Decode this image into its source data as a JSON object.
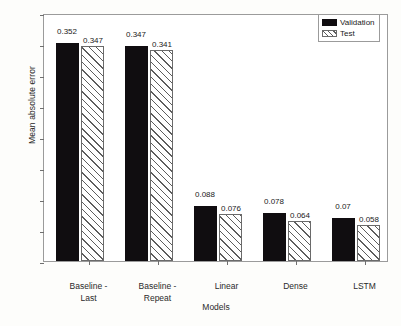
{
  "chart_data": {
    "type": "bar",
    "title": "",
    "xlabel": "Models",
    "ylabel": "Mean absolute error",
    "categories": [
      "Baseline -\nLast",
      "Baseline -\nRepeat",
      "Linear",
      "Dense",
      "LSTM"
    ],
    "category_lines": [
      [
        "Baseline -",
        "Last"
      ],
      [
        "Baseline -",
        "Repeat"
      ],
      [
        "Linear",
        ""
      ],
      [
        "Dense",
        ""
      ],
      [
        "LSTM",
        ""
      ]
    ],
    "series": [
      {
        "name": "Validation",
        "values": [
          0.352,
          0.347,
          0.088,
          0.078,
          0.07
        ],
        "labels": [
          "0.352",
          "0.347",
          "0.088",
          "0.078",
          "0.07"
        ],
        "color": "#100d10",
        "pattern": "solid"
      },
      {
        "name": "Test",
        "values": [
          0.347,
          0.341,
          0.076,
          0.064,
          0.058
        ],
        "labels": [
          "0.347",
          "0.341",
          "0.076",
          "0.064",
          "0.058"
        ],
        "color": "#ffffff",
        "pattern": "diagonal-hatch"
      }
    ],
    "ylim": [
      0.0,
      0.4
    ],
    "ytick_values": [
      0.0,
      0.05,
      0.1,
      0.15,
      0.2,
      0.25,
      0.3,
      0.35,
      0.4
    ],
    "ytick_labels": [
      "0.00",
      "0.05",
      "0.10",
      "0.15",
      "0.20",
      "0.25",
      "0.30",
      "0.35",
      "0.40"
    ],
    "grid": false,
    "legend_position": "top-right",
    "legend_entries": [
      "Validation",
      "Test"
    ]
  }
}
